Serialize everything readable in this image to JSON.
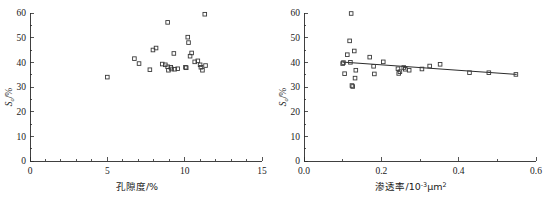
{
  "figure": {
    "background": "#ffffff",
    "foreground": "#1a1a1a",
    "marker_color": "#3a3a3a",
    "line_color": "#2b2b2b"
  },
  "chart_data": [
    {
      "id": "left",
      "type": "scatter",
      "title": "",
      "xlabel": "孔隙度/%",
      "ylabel": "So/%",
      "ylabel_base": "S",
      "ylabel_sub": "o",
      "ylabel_unit": "/%",
      "xlim": [
        0,
        15
      ],
      "ylim": [
        0,
        60
      ],
      "xticks": [
        0,
        5,
        10,
        15
      ],
      "xticklabels": [
        "0",
        "5",
        "10",
        "15"
      ],
      "yticks": [
        0,
        10,
        20,
        30,
        40,
        50,
        60
      ],
      "yticklabels": [
        "0",
        "10",
        "20",
        "30",
        "40",
        "50",
        "60"
      ],
      "x_minor_ticks": [
        1,
        2,
        3,
        4,
        6,
        7,
        8,
        9,
        11,
        12,
        13,
        14
      ],
      "y_minor_ticks": [
        5,
        15,
        25,
        35,
        45,
        55
      ],
      "grid": false,
      "legend": "none",
      "marker": "open-square",
      "has_trendline": false,
      "points": [
        {
          "x": 5.0,
          "y": 34.0
        },
        {
          "x": 6.75,
          "y": 41.5
        },
        {
          "x": 7.05,
          "y": 39.5
        },
        {
          "x": 7.75,
          "y": 37.0
        },
        {
          "x": 7.95,
          "y": 45.0
        },
        {
          "x": 8.15,
          "y": 45.8
        },
        {
          "x": 8.55,
          "y": 39.3
        },
        {
          "x": 8.75,
          "y": 39.0
        },
        {
          "x": 8.9,
          "y": 56.2
        },
        {
          "x": 8.9,
          "y": 38.2
        },
        {
          "x": 8.95,
          "y": 36.8
        },
        {
          "x": 9.1,
          "y": 38.0
        },
        {
          "x": 9.15,
          "y": 37.3
        },
        {
          "x": 9.3,
          "y": 43.6
        },
        {
          "x": 9.35,
          "y": 37.2
        },
        {
          "x": 9.55,
          "y": 37.4
        },
        {
          "x": 10.05,
          "y": 38.0
        },
        {
          "x": 10.1,
          "y": 37.8
        },
        {
          "x": 10.2,
          "y": 50.2
        },
        {
          "x": 10.25,
          "y": 48.0
        },
        {
          "x": 10.35,
          "y": 42.5
        },
        {
          "x": 10.45,
          "y": 43.8
        },
        {
          "x": 10.65,
          "y": 40.2
        },
        {
          "x": 10.85,
          "y": 40.6
        },
        {
          "x": 11.0,
          "y": 39.0
        },
        {
          "x": 11.05,
          "y": 38.0
        },
        {
          "x": 11.15,
          "y": 36.8
        },
        {
          "x": 11.3,
          "y": 59.5
        },
        {
          "x": 11.35,
          "y": 38.7
        }
      ]
    },
    {
      "id": "right",
      "type": "scatter",
      "title": "",
      "xlabel": "渗透率/10⁻³μm²",
      "xlabel_base": "渗透率/10",
      "xlabel_sup1": "-3",
      "xlabel_mid": "μm",
      "xlabel_sup2": "2",
      "ylabel": "So/%",
      "ylabel_base": "S",
      "ylabel_sub": "o",
      "ylabel_unit": "/%",
      "xlim": [
        0.0,
        0.6
      ],
      "ylim": [
        0,
        60
      ],
      "xticks": [
        0.0,
        0.2,
        0.4,
        0.6
      ],
      "xticklabels": [
        "0.0",
        "0.2",
        "0.4",
        "0.6"
      ],
      "yticks": [
        0,
        10,
        20,
        30,
        40,
        50,
        60
      ],
      "yticklabels": [
        "0",
        "10",
        "20",
        "30",
        "40",
        "50",
        "60"
      ],
      "x_minor_ticks": [
        0.1,
        0.3,
        0.5
      ],
      "y_minor_ticks": [
        5,
        15,
        25,
        35,
        45,
        55
      ],
      "grid": false,
      "legend": "none",
      "marker": "open-square",
      "has_trendline": true,
      "trendline": {
        "x1": 0.1,
        "y1": 40.1,
        "x2": 0.55,
        "y2": 35.1
      },
      "points": [
        {
          "x": 0.1,
          "y": 39.5
        },
        {
          "x": 0.102,
          "y": 39.9
        },
        {
          "x": 0.105,
          "y": 35.4
        },
        {
          "x": 0.112,
          "y": 43.1
        },
        {
          "x": 0.118,
          "y": 48.7
        },
        {
          "x": 0.12,
          "y": 40.0
        },
        {
          "x": 0.122,
          "y": 59.8
        },
        {
          "x": 0.124,
          "y": 30.6
        },
        {
          "x": 0.126,
          "y": 30.2
        },
        {
          "x": 0.13,
          "y": 44.6
        },
        {
          "x": 0.132,
          "y": 33.6
        },
        {
          "x": 0.134,
          "y": 36.8
        },
        {
          "x": 0.17,
          "y": 42.1
        },
        {
          "x": 0.18,
          "y": 38.4
        },
        {
          "x": 0.182,
          "y": 35.3
        },
        {
          "x": 0.205,
          "y": 40.2
        },
        {
          "x": 0.243,
          "y": 37.4
        },
        {
          "x": 0.245,
          "y": 35.5
        },
        {
          "x": 0.248,
          "y": 36.2
        },
        {
          "x": 0.258,
          "y": 37.9
        },
        {
          "x": 0.262,
          "y": 37.2
        },
        {
          "x": 0.272,
          "y": 36.8
        },
        {
          "x": 0.305,
          "y": 37.3
        },
        {
          "x": 0.325,
          "y": 38.5
        },
        {
          "x": 0.352,
          "y": 39.2
        },
        {
          "x": 0.428,
          "y": 35.8
        },
        {
          "x": 0.478,
          "y": 35.8
        },
        {
          "x": 0.548,
          "y": 35.1
        }
      ]
    }
  ]
}
